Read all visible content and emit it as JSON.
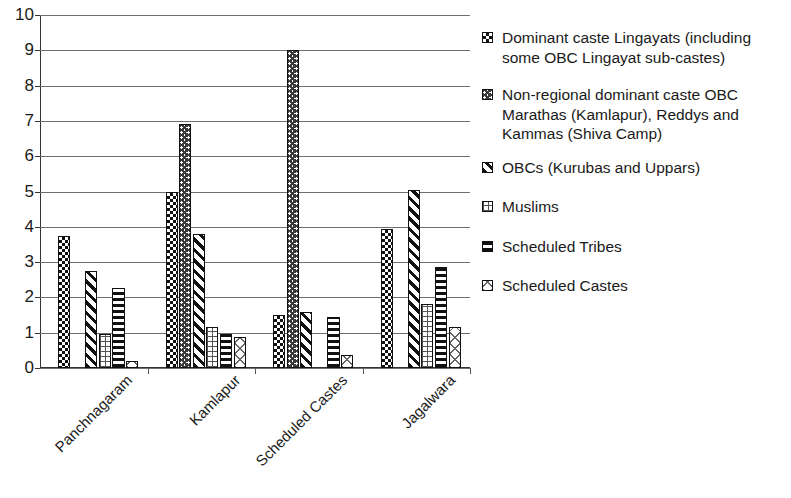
{
  "chart_data": {
    "type": "bar",
    "title": "",
    "subtitle": "",
    "xlabel": "",
    "ylabel": "",
    "ylim": [
      0,
      10
    ],
    "yticks": [
      0,
      1,
      2,
      3,
      4,
      5,
      6,
      7,
      8,
      9,
      10
    ],
    "ytick_labels": [
      "0",
      "1",
      "2",
      "3",
      "4",
      "5",
      "6",
      "7",
      "8",
      "9",
      "10"
    ],
    "grid": true,
    "grid_axis": "y",
    "legend_position": "right",
    "categories": [
      "Panchnagaram",
      "Kamlapur",
      "Scheduled Castes",
      "Jagalwara"
    ],
    "series": [
      {
        "name": "Dominant caste Lingayats (including some OBC Lingayat sub-castes)",
        "pattern": "checker",
        "values": [
          3.75,
          5.0,
          1.5,
          3.95
        ]
      },
      {
        "name": "Non-regional dominant caste OBC Marathas (Kamlapur), Reddys and Kammas (Shiva Camp)",
        "pattern": "zigzag",
        "values": [
          0,
          6.9,
          9.0,
          0
        ]
      },
      {
        "name": "OBCs (Kurubas and Uppars)",
        "pattern": "diagonal",
        "values": [
          2.75,
          3.8,
          1.6,
          5.05
        ]
      },
      {
        "name": "Muslims",
        "pattern": "grid",
        "values": [
          0.95,
          1.15,
          0,
          1.8
        ]
      },
      {
        "name": "Scheduled Tribes",
        "pattern": "hlines",
        "values": [
          2.28,
          0.95,
          1.45,
          2.85
        ]
      },
      {
        "name": "Scheduled Castes",
        "pattern": "crosshatch",
        "values": [
          0.2,
          0.88,
          0.38,
          1.15
        ]
      }
    ]
  },
  "legend": {
    "items": [
      {
        "label": "Dominant caste Lingayats (including some OBC Lingayat sub-castes)",
        "pattern": "checker"
      },
      {
        "label": "Non-regional dominant caste OBC Marathas (Kamlapur), Reddys and Kammas (Shiva Camp)",
        "pattern": "zigzag"
      },
      {
        "label": "OBCs (Kurubas and Uppars)",
        "pattern": "diagonal"
      },
      {
        "label": "Muslims",
        "pattern": "grid"
      },
      {
        "label": "Scheduled Tribes",
        "pattern": "hlines"
      },
      {
        "label": "Scheduled Castes",
        "pattern": "crosshatch"
      }
    ]
  },
  "colors": {
    "ink": "#111111",
    "grid": "#6e6e6e",
    "axis": "#333333",
    "background": "#ffffff"
  }
}
